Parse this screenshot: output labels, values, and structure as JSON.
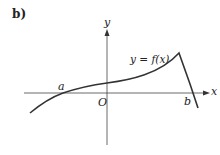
{
  "part_label": "b)",
  "axes": {
    "x_label": "x",
    "y_label": "y",
    "origin_label": "O"
  },
  "curve": {
    "label": "y = f(x)",
    "root_left_label": "a",
    "root_right_label": "b",
    "color": "#333333"
  }
}
